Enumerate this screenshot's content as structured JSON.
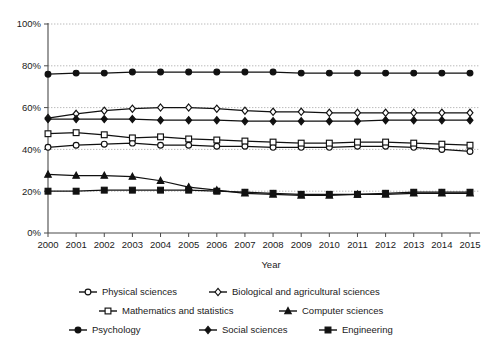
{
  "chart_data": {
    "type": "line",
    "title": "",
    "xlabel": "Year",
    "ylabel": "",
    "grid": "horizontal dotted gridlines at every 20%",
    "legend_position": "bottom",
    "ylim": [
      0,
      100
    ],
    "ytick_labels": [
      "0%",
      "20%",
      "40%",
      "60%",
      "80%",
      "100%"
    ],
    "ytick_values": [
      0,
      20,
      40,
      60,
      80,
      100
    ],
    "categories": [
      "2000",
      "2001",
      "2002",
      "2003",
      "2004",
      "2005",
      "2006",
      "2007",
      "2008",
      "2009",
      "2010",
      "2011",
      "2012",
      "2013",
      "2014",
      "2015"
    ],
    "x": [
      2000,
      2001,
      2002,
      2003,
      2004,
      2005,
      2006,
      2007,
      2008,
      2009,
      2010,
      2011,
      2012,
      2013,
      2014,
      2015
    ],
    "series": [
      {
        "name": "Physical sciences",
        "marker": "open-circle",
        "values": [
          41,
          42,
          42.5,
          43,
          42,
          42,
          41.5,
          41.5,
          41,
          41,
          41,
          41.5,
          41.5,
          41,
          40,
          39
        ]
      },
      {
        "name": "Biological and agricultural sciences",
        "marker": "open-diamond",
        "values": [
          55,
          57,
          58.5,
          59.5,
          60,
          60,
          59.5,
          58.5,
          58,
          58,
          57.5,
          57.5,
          57.5,
          57.5,
          57.5,
          57.5
        ]
      },
      {
        "name": "Mathematics and statistics",
        "marker": "open-square",
        "values": [
          47.5,
          48,
          47,
          45.5,
          46,
          45,
          44.5,
          44,
          43.5,
          43,
          43,
          43.5,
          43.5,
          43,
          42.5,
          42
        ]
      },
      {
        "name": "Computer sciences",
        "marker": "filled-triangle",
        "values": [
          28,
          27.5,
          27.5,
          27,
          25,
          22,
          20.5,
          19,
          18.5,
          18,
          18,
          18.5,
          18.5,
          19,
          19,
          19
        ]
      },
      {
        "name": "Psychology",
        "marker": "filled-circle",
        "values": [
          76,
          76.5,
          76.5,
          77,
          77,
          77,
          77,
          77,
          77,
          76.5,
          76.5,
          76.5,
          76.5,
          76.5,
          76.5,
          76.5
        ]
      },
      {
        "name": "Social sciences",
        "marker": "filled-diamond",
        "values": [
          54.5,
          54.5,
          54.5,
          54.5,
          54,
          54,
          54,
          53.5,
          53.5,
          53.5,
          53.5,
          53.5,
          54,
          54,
          54,
          54
        ]
      },
      {
        "name": "Engineering",
        "marker": "filled-square",
        "values": [
          20,
          20,
          20.5,
          20.5,
          20.5,
          20.5,
          20,
          19.5,
          19,
          18.5,
          18.5,
          18.5,
          19,
          19.5,
          19.5,
          19.5
        ]
      }
    ]
  },
  "legend": {
    "items": [
      {
        "label": "Physical sciences",
        "marker": "open-circle"
      },
      {
        "label": "Biological and agricultural sciences",
        "marker": "open-diamond"
      },
      {
        "label": "Mathematics and statistics",
        "marker": "open-square"
      },
      {
        "label": "Computer sciences",
        "marker": "filled-triangle"
      },
      {
        "label": "Psychology",
        "marker": "filled-circle"
      },
      {
        "label": "Social sciences",
        "marker": "filled-diamond"
      },
      {
        "label": "Engineering",
        "marker": "filled-square"
      }
    ]
  },
  "colors": {
    "line": "#111111",
    "grid": "#a8a8a8",
    "axis": "#4a4a4a",
    "background": "#ffffff"
  }
}
